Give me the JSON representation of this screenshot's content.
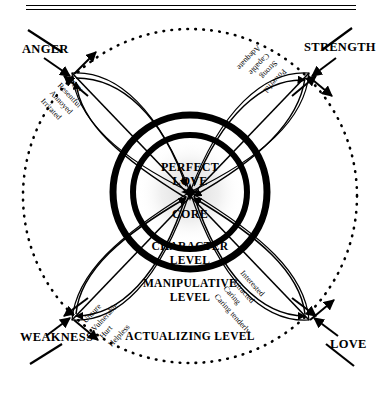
{
  "diagram": {
    "title_rules": 2,
    "center": {
      "core_label": "CORE",
      "perfect_love_label": "PERFECT\nLOVE",
      "perfect_love_line1": "PERFECT",
      "perfect_love_line2": "LOVE"
    },
    "levels": [
      {
        "id": "character",
        "line1": "CHARACTER",
        "line2": "LEVEL"
      },
      {
        "id": "manipulative",
        "line1": "MANIPULATIVE",
        "line2": "LEVEL"
      },
      {
        "id": "actualizing",
        "line1": "ACTUALIZING LEVEL",
        "line2": ""
      }
    ],
    "corners": [
      {
        "id": "anger",
        "label": "ANGER"
      },
      {
        "id": "strength",
        "label": "STRENGTH"
      },
      {
        "id": "weakness",
        "label": "WEAKNESS"
      },
      {
        "id": "love",
        "label": "LOVE"
      }
    ],
    "petals": [
      {
        "id": "anger",
        "words": [
          "Angry",
          "Resentful",
          "Annoyed",
          "Irritated"
        ]
      },
      {
        "id": "strength",
        "words": [
          "Powerful",
          "Strong",
          "Capable",
          "Adequate"
        ]
      },
      {
        "id": "weakness",
        "words": [
          "Unsure",
          "Vulnerable",
          "Hurt",
          "Helpless"
        ]
      },
      {
        "id": "love",
        "words": [
          "Interested",
          "Attracted",
          "Caring",
          "Caring tenderly"
        ]
      }
    ],
    "colors": {
      "ink": "#000000",
      "paper": "#ffffff",
      "halo": "#d9d9d9"
    }
  }
}
